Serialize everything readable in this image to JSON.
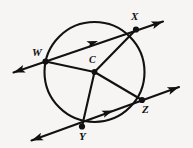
{
  "figure": {
    "type": "geometry-diagram",
    "width": 193,
    "height": 148,
    "background_color": "#f6f5f3",
    "stroke_color": "#111111",
    "label_color": "#101010"
  },
  "circle": {
    "center_label": "C",
    "center": {
      "x": 94.5,
      "y": 72
    },
    "radius": 50,
    "stroke_width": 2.1
  },
  "points": [
    {
      "id": "W",
      "label": "W",
      "x": 45.5,
      "y": 61.5,
      "label_x": 32,
      "label_y": 47,
      "on_circle": true
    },
    {
      "id": "X",
      "label": "X",
      "x": 136,
      "y": 29.5,
      "label_x": 131,
      "label_y": 11,
      "on_circle": true
    },
    {
      "id": "C",
      "label": "C",
      "x": 94.5,
      "y": 72,
      "label_x": 89,
      "label_y": 55,
      "on_circle": false
    },
    {
      "id": "Z",
      "label": "Z",
      "x": 142,
      "y": 100,
      "label_x": 142,
      "label_y": 104,
      "on_circle": true
    },
    {
      "id": "Y",
      "label": "Y",
      "x": 82,
      "y": 126.5,
      "label_x": 79,
      "label_y": 131,
      "on_circle": true
    }
  ],
  "radii": [
    {
      "name": "segment-CW",
      "from": "C",
      "to": "W"
    },
    {
      "name": "segment-CX",
      "from": "C",
      "to": "X"
    },
    {
      "name": "segment-CY",
      "from": "C",
      "to": "Y"
    },
    {
      "name": "segment-CZ",
      "from": "C",
      "to": "Z"
    }
  ],
  "lines": [
    {
      "name": "line-WX",
      "through": [
        "W",
        "X"
      ],
      "x1": 13.5,
      "y1": 72.5,
      "x2": 163,
      "y2": 21.5,
      "arrow_start": true,
      "arrow_end": true,
      "mid_arrow": {
        "x": 98,
        "y": 41,
        "angle_deg": -18.8
      }
    },
    {
      "name": "line-YZ",
      "through": [
        "Y",
        "Z"
      ],
      "x1": 31.5,
      "y1": 140.5,
      "x2": 179,
      "y2": 87,
      "arrow_start": true,
      "arrow_end": true,
      "mid_arrow": {
        "x": 113,
        "y": 110.5,
        "angle_deg": -19.8
      }
    }
  ],
  "arrow": {
    "length": 11,
    "half_width": 3.6
  }
}
